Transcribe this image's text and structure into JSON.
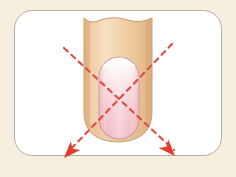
{
  "figure": {
    "caption": "",
    "background_color": "#f6efdf",
    "panel": {
      "fill": "#ffffff",
      "border_color": "#b5aea2",
      "x": 14,
      "y": 10,
      "width": 208,
      "height": 146,
      "corner_radius": 18
    },
    "baseline_rule": {
      "color": "#cdc2ac",
      "x1": 12,
      "x2": 230,
      "y": 169,
      "thickness": 1.4
    },
    "finger": {
      "label": "finger",
      "skin_fill_light": "#f7dfbe",
      "skin_fill_mid": "#efcda1",
      "skin_fill_dark": "#e0b485",
      "outline_color": "#c9a274",
      "left_x": 84,
      "right_x": 152,
      "top_y": 18,
      "tip_y": 142
    },
    "nail": {
      "label": "fingernail",
      "fill_top": "#fffafb",
      "fill_mid": "#f8d8dd",
      "fill_bottom": "#f3b9c2",
      "outline_color": "#c99aa6",
      "x": 99,
      "y": 57,
      "width": 40,
      "height": 82,
      "corner_radius": 20
    },
    "guides": {
      "label": "filing-direction-guides",
      "color": "#e0504a",
      "dash_pattern": "5 5",
      "stroke_width": 2.2,
      "lines": [
        {
          "name": "guide-line-down-right",
          "x1": 64,
          "y1": 48,
          "x2": 176,
          "y2": 150
        },
        {
          "name": "guide-line-down-left",
          "x1": 172,
          "y1": 44,
          "x2": 66,
          "y2": 152
        }
      ]
    },
    "arrows": [
      {
        "name": "arrow-down-left",
        "tip_x": 66,
        "tip_y": 156,
        "angle_deg": 225,
        "color": "#e23b2e"
      },
      {
        "name": "arrow-down-right",
        "tip_x": 172,
        "tip_y": 154,
        "angle_deg": 315,
        "color": "#e23b2e"
      }
    ]
  }
}
